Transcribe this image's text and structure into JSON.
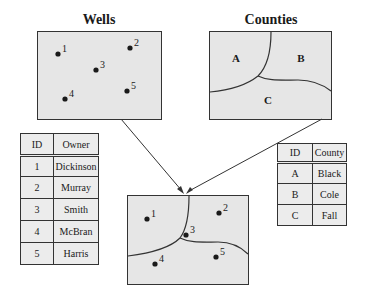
{
  "wells": {
    "title": "Wells",
    "points": [
      {
        "id": "1",
        "x": 58,
        "y": 54
      },
      {
        "id": "2",
        "x": 130,
        "y": 48
      },
      {
        "id": "3",
        "x": 96,
        "y": 70
      },
      {
        "id": "4",
        "x": 65,
        "y": 99
      },
      {
        "id": "5",
        "x": 127,
        "y": 91
      }
    ]
  },
  "counties": {
    "title": "Counties",
    "regions": [
      {
        "id": "A",
        "x": 236,
        "y": 62
      },
      {
        "id": "B",
        "x": 301,
        "y": 62
      },
      {
        "id": "C",
        "x": 268,
        "y": 104
      }
    ]
  },
  "owner_table": {
    "headers": [
      "ID",
      "Owner"
    ],
    "rows": [
      [
        "1",
        "Dickinson"
      ],
      [
        "2",
        "Murray"
      ],
      [
        "3",
        "Smith"
      ],
      [
        "4",
        "McBran"
      ],
      [
        "5",
        "Harris"
      ]
    ]
  },
  "county_table": {
    "headers": [
      "ID",
      "County"
    ],
    "rows": [
      [
        "A",
        "Black"
      ],
      [
        "B",
        "Cole"
      ],
      [
        "C",
        "Fall"
      ]
    ]
  },
  "overlay": {
    "points": [
      {
        "id": "1",
        "x": 147,
        "y": 219
      },
      {
        "id": "2",
        "x": 219,
        "y": 213
      },
      {
        "id": "3",
        "x": 186,
        "y": 235
      },
      {
        "id": "4",
        "x": 155,
        "y": 264
      },
      {
        "id": "5",
        "x": 216,
        "y": 257
      }
    ]
  },
  "colors": {
    "map_fill": "#e6e6e6",
    "line": "#333333",
    "table_fill": "#ececec"
  }
}
